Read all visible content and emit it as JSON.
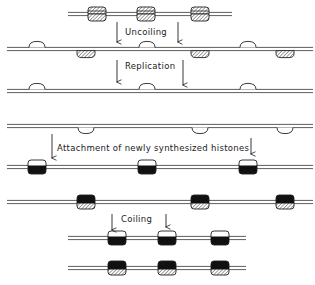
{
  "diagram": {
    "type": "nucleosome-replication-schematic",
    "steps": [
      {
        "id": "uncoiling",
        "label": "Uncoiling"
      },
      {
        "id": "replication",
        "label": "Replication"
      },
      {
        "id": "attachment",
        "label": "Attachment of newly synthesized histones"
      },
      {
        "id": "coiling",
        "label": "Coiling"
      }
    ],
    "legend_implied": {
      "hatched": "parental histone half",
      "open": "parental histone half (open)",
      "solid_black": "newly synthesized histone half"
    },
    "colors": {
      "line": "#333333",
      "fill_new": "#111111",
      "fill_open": "#ffffff",
      "hatch": "#555555"
    },
    "rows": [
      {
        "name": "parental-chromatin",
        "y": 14,
        "x1": 68,
        "x2": 232,
        "nucleosomes": [
          97,
          146,
          200
        ],
        "style": "hatched-full"
      },
      {
        "name": "uncoiled-dna",
        "y": 49,
        "x1": 7,
        "x2": 313,
        "top_open": [
          37,
          147,
          248
        ],
        "bottom_hatched": [
          86,
          200,
          285
        ]
      },
      {
        "name": "daughter-strand-1",
        "y": 91,
        "x1": 7,
        "x2": 313,
        "top_open": [
          37,
          147,
          248
        ]
      },
      {
        "name": "daughter-strand-2",
        "y": 126,
        "x1": 7,
        "x2": 313,
        "bottom_open": [
          86,
          200,
          285
        ]
      },
      {
        "name": "daughter-1-with-new-histones",
        "y": 167,
        "x1": 7,
        "x2": 313,
        "nucleosomes": [
          37,
          147,
          248
        ],
        "style": "open-top-black-bottom"
      },
      {
        "name": "daughter-2-with-new-histones",
        "y": 202,
        "x1": 7,
        "x2": 313,
        "nucleosomes": [
          86,
          200,
          285
        ],
        "style": "black-top-hatched-bottom"
      },
      {
        "name": "coiled-daughter-1",
        "y": 238,
        "x1": 68,
        "x2": 246,
        "nucleosomes": [
          117,
          167,
          220
        ],
        "style": "open-top-black-bottom"
      },
      {
        "name": "coiled-daughter-2",
        "y": 268,
        "x1": 68,
        "x2": 246,
        "nucleosomes": [
          117,
          167,
          220
        ],
        "style": "black-top-hatched-bottom"
      }
    ]
  }
}
